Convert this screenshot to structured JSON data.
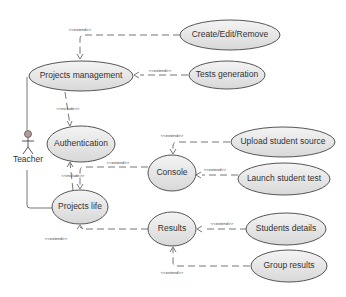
{
  "diagram": {
    "type": "uml-use-case",
    "actor": {
      "label": "Teacher"
    },
    "use_cases": {
      "projects_management": "Projects management",
      "create_edit_remove": "Create/Edit/Remove",
      "tests_generation": "Tests generation",
      "authentication": "Authentication",
      "console": "Console",
      "upload_student_source": "Upload student source",
      "launch_student_test": "Launch student test",
      "projects_life": "Projects life",
      "results": "Results",
      "students_details": "Students details",
      "group_results": "Group results"
    },
    "stereotypes": {
      "extend": "<<extend>>",
      "include": "<<include>>"
    },
    "relations": [
      {
        "from": "create_edit_remove",
        "to": "projects_management",
        "type": "<<extend>>"
      },
      {
        "from": "tests_generation",
        "to": "projects_management",
        "type": "<<extend>>"
      },
      {
        "from": "projects_management",
        "to": "authentication",
        "type": "<<include>>"
      },
      {
        "from": "projects_life",
        "to": "authentication",
        "type": "<<include>>"
      },
      {
        "from": "upload_student_source",
        "to": "console",
        "type": "<<extend>>"
      },
      {
        "from": "launch_student_test",
        "to": "console",
        "type": "<<extend>>"
      },
      {
        "from": "console",
        "to": "projects_life",
        "type": "<<extend>>"
      },
      {
        "from": "results",
        "to": "projects_life",
        "type": "<<extend>>"
      },
      {
        "from": "students_details",
        "to": "results",
        "type": "<<extend>>"
      },
      {
        "from": "group_results",
        "to": "results",
        "type": "<<extend>>"
      }
    ]
  }
}
